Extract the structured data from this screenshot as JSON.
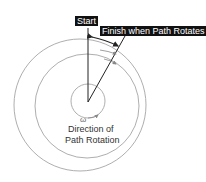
{
  "diagram": {
    "labels": {
      "start": "Start",
      "finish": "Finish when Path Rotates",
      "omega": "ω",
      "caption_line1": "Direction of",
      "caption_line2": "Path Rotation"
    },
    "colors": {
      "line": "#222222",
      "circle": "#999999",
      "arrow": "#888888",
      "label_bg": "#111111",
      "label_text": "#ffffff"
    }
  }
}
